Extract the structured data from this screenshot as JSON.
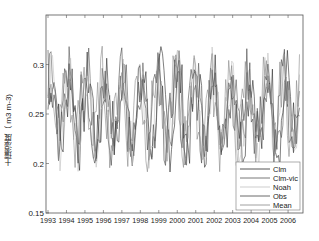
{
  "chart_data": {
    "type": "line",
    "title": "",
    "xlabel": "",
    "ylabel": "土壤湿度（ m3 m-3)",
    "xlim": [
      1993,
      2006.9
    ],
    "ylim": [
      0.15,
      0.35
    ],
    "grid": false,
    "legend_position": "lower right",
    "x_ticks": [
      "1993",
      "1994",
      "1995",
      "1996",
      "1997",
      "1998",
      "1999",
      "2000",
      "2001",
      "2002",
      "2003",
      "2004",
      "2005",
      "2006"
    ],
    "y_ticks": [
      "0.15",
      "0.2",
      "0.25",
      "0.3"
    ],
    "series": [
      {
        "name": "Clm",
        "color": "#2a2a2a"
      },
      {
        "name": "Clm-vic",
        "color": "#555555"
      },
      {
        "name": "Noah",
        "color": "#c0c0c0"
      },
      {
        "name": "Obs",
        "color": "#444444"
      },
      {
        "name": "Mean",
        "color": "#888888"
      }
    ],
    "note": "Monthly soil moisture time series 1993–2006, values fluctuating roughly between 0.19 and 0.32 m3 m-3"
  },
  "legend": {
    "items": [
      "Clm",
      "Clm-vic",
      "Noah",
      "Obs",
      "Mean"
    ]
  }
}
